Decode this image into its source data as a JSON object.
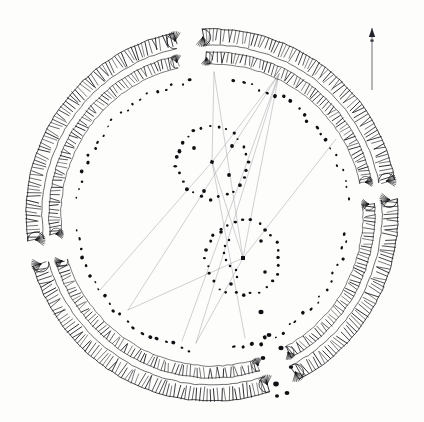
{
  "figure": {
    "kind": "archaeological-site-plan",
    "title": "",
    "background_color": "#fdfdfc",
    "ink_color": "#101014",
    "survey_line_color": "#9a9aa0",
    "width": 424,
    "height": 422
  },
  "north_arrow": {
    "name": "north-arrow",
    "x": 372,
    "y_top": 28,
    "y_bottom": 90,
    "head_length": 9,
    "head_half_width": 3.2,
    "label": ""
  },
  "chart_data": {
    "type": "scatter",
    "title": "",
    "xlabel": "",
    "ylabel": "",
    "xlim": [
      0,
      424
    ],
    "ylim": [
      0,
      422
    ],
    "grid": false,
    "legend": "none",
    "note": "Plan coordinates in image pixel space; y increases downward.",
    "henge_center": {
      "cx": 212,
      "cy": 215
    },
    "earthwork_bank": {
      "name": "outer-bank-hachured",
      "description": "Hachured earthwork bank drawn as paired arcs with inward-pointing tick marks; broken by four entrance causeways",
      "radius_outer": 186,
      "radius_inner": 170,
      "hachure_length": 13,
      "hachure_spacing_deg": 1.15,
      "segments_deg": [
        [
          267,
          349
        ],
        [
          355,
          62
        ],
        [
          72,
          164
        ],
        [
          172,
          258
        ]
      ]
    },
    "earthwork_ditch": {
      "name": "inner-ditch-hachured",
      "description": "Inner ditch scarp, hachured, concentric inside the bank",
      "radius_outer": 163,
      "radius_inner": 151,
      "hachure_length": 10,
      "hachure_spacing_deg": 1.3,
      "segments_deg": [
        [
          268,
          348
        ],
        [
          356,
          61
        ],
        [
          73,
          163
        ],
        [
          173,
          257
        ]
      ]
    },
    "great_stone_circle": {
      "name": "great-outer-stone-circle",
      "description": "Outer ring of individual standing-stone positions drawn as filled dots/ovals",
      "radius": 136,
      "stone_count": 98,
      "stone_size_min": 2.0,
      "stone_size_max": 4.2,
      "gaps_deg": [
        [
          84,
          96
        ],
        [
          264,
          276
        ],
        [
          174,
          186
        ],
        [
          354,
          6
        ]
      ]
    },
    "inner_circles": [
      {
        "name": "north-inner-circle",
        "cx": 212,
        "cy": 162,
        "radius": 36,
        "stone_count": 27,
        "stone_size": 2.6,
        "center_feature": "cove"
      },
      {
        "name": "south-inner-circle",
        "cx": 243,
        "cy": 258,
        "radius": 37,
        "stone_count": 28,
        "stone_size": 2.6,
        "center_feature": "obelisk"
      }
    ],
    "cove": {
      "name": "north-circle-cove",
      "cx": 212,
      "cy": 162,
      "marker_size": 3.4,
      "satellite_stones": [
        {
          "x": 194,
          "y": 148
        },
        {
          "x": 232,
          "y": 146
        },
        {
          "x": 229,
          "y": 175
        },
        {
          "x": 204,
          "y": 191
        }
      ]
    },
    "obelisk": {
      "name": "the-obelisk",
      "cx": 243,
      "cy": 258,
      "marker_size": 4.0,
      "z_feature_arc": {
        "description": "Short arc of small stones (the Z-feature) curving west and south of the Obelisk",
        "points": [
          {
            "x": 229,
            "y": 240
          },
          {
            "x": 225,
            "y": 246
          },
          {
            "x": 224,
            "y": 253
          },
          {
            "x": 226,
            "y": 260
          },
          {
            "x": 230,
            "y": 266
          },
          {
            "x": 236,
            "y": 270
          },
          {
            "x": 237,
            "y": 277
          }
        ]
      },
      "satellite_stones": [
        {
          "x": 221,
          "y": 232
        },
        {
          "x": 261,
          "y": 241
        },
        {
          "x": 265,
          "y": 272
        },
        {
          "x": 231,
          "y": 284
        }
      ]
    },
    "outlying_stones": {
      "name": "southern-outlying-stones",
      "description": "Isolated stones south-east of the south entrance, start of the avenue",
      "points": [
        {
          "x": 261,
          "y": 312,
          "r": 2.6
        },
        {
          "x": 269,
          "y": 335,
          "r": 2.4
        },
        {
          "x": 281,
          "y": 348,
          "r": 2.6
        },
        {
          "x": 263,
          "y": 358,
          "r": 2.3
        },
        {
          "x": 291,
          "y": 367,
          "r": 2.2
        },
        {
          "x": 276,
          "y": 384,
          "r": 2.8
        },
        {
          "x": 287,
          "y": 393,
          "r": 2.4
        },
        {
          "x": 277,
          "y": 396,
          "r": 2.0
        }
      ]
    },
    "survey_lines": {
      "name": "sight-line-network",
      "description": "Faint ruled alignment / sight lines drawn across the monument between survey nodes",
      "nodes": [
        {
          "id": "ne-node",
          "x": 279,
          "y": 74
        },
        {
          "id": "north-circle-centre",
          "x": 212,
          "y": 162
        },
        {
          "id": "obelisk",
          "x": 243,
          "y": 258
        },
        {
          "id": "sw-terminal",
          "x": 182,
          "y": 341
        },
        {
          "id": "s-terminal",
          "x": 196,
          "y": 343
        },
        {
          "id": "se-terminal",
          "x": 245,
          "y": 338
        },
        {
          "id": "w-terminal",
          "x": 100,
          "y": 290
        },
        {
          "id": "nw-terminal",
          "x": 214,
          "y": 72
        },
        {
          "id": "e-terminal",
          "x": 336,
          "y": 139
        },
        {
          "id": "sw-far",
          "x": 128,
          "y": 310
        }
      ],
      "lines": [
        [
          "ne-node",
          "north-circle-centre"
        ],
        [
          "ne-node",
          "obelisk"
        ],
        [
          "ne-node",
          "sw-terminal"
        ],
        [
          "ne-node",
          "s-terminal"
        ],
        [
          "ne-node",
          "sw-far"
        ],
        [
          "north-circle-centre",
          "se-terminal"
        ],
        [
          "north-circle-centre",
          "w-terminal"
        ],
        [
          "north-circle-centre",
          "nw-terminal"
        ],
        [
          "obelisk",
          "nw-terminal"
        ],
        [
          "obelisk",
          "e-terminal"
        ],
        [
          "obelisk",
          "sw-far"
        ],
        [
          "obelisk",
          "s-terminal"
        ],
        [
          "north-circle-centre",
          "obelisk"
        ]
      ]
    },
    "entrance_causeways": [
      {
        "name": "north-entrance",
        "angle_deg": 270
      },
      {
        "name": "east-entrance",
        "angle_deg": 0
      },
      {
        "name": "south-entrance",
        "angle_deg": 90
      },
      {
        "name": "west-entrance",
        "angle_deg": 180
      }
    ]
  }
}
